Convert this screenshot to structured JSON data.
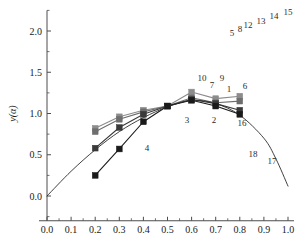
{
  "chart_data": {
    "type": "line",
    "title": "",
    "xlabel": "α",
    "ylabel": "y(α)",
    "xlim": [
      0.0,
      1.0
    ],
    "ylim": [
      -0.35,
      2.35
    ],
    "grid": false,
    "legend_position": "none",
    "x_ticks": [
      "0.0",
      "0.1",
      "0.2",
      "0.3",
      "0.4",
      "0.5",
      "0.6",
      "0.7",
      "0.8",
      "0.9",
      "1.0"
    ],
    "x_tick_values": [
      0.0,
      0.1,
      0.2,
      0.3,
      0.4,
      0.5,
      0.6,
      0.7,
      0.8,
      0.9,
      1.0
    ],
    "y_ticks": [
      "0.0",
      "0.5",
      "1.0",
      "1.5",
      "2.0"
    ],
    "y_tick_values": [
      0.0,
      0.5,
      1.0,
      1.5,
      2.0
    ],
    "series": [
      {
        "name": "series-1",
        "color": "#8c8c8c",
        "marker": "square",
        "x": [
          0.2,
          0.3,
          0.4,
          0.5,
          0.6,
          0.7,
          0.8
        ],
        "values": [
          0.82,
          0.96,
          1.04,
          1.09,
          1.26,
          1.18,
          1.21
        ]
      },
      {
        "name": "series-2",
        "color": "#6e6e6e",
        "marker": "square",
        "x": [
          0.2,
          0.3,
          0.4,
          0.5,
          0.6,
          0.7,
          0.8
        ],
        "values": [
          0.78,
          0.93,
          1.02,
          1.09,
          1.19,
          1.13,
          1.15
        ]
      },
      {
        "name": "series-3",
        "color": "#3a3a3a",
        "marker": "square",
        "x": [
          0.2,
          0.3,
          0.4,
          0.5,
          0.6,
          0.7,
          0.8
        ],
        "values": [
          0.58,
          0.83,
          0.99,
          1.09,
          1.17,
          1.12,
          1.04
        ]
      },
      {
        "name": "series-4",
        "color": "#1a1a1a",
        "marker": "square",
        "x": [
          0.2,
          0.3,
          0.4,
          0.5,
          0.6,
          0.7,
          0.8
        ],
        "values": [
          0.25,
          0.57,
          0.9,
          1.09,
          1.16,
          1.09,
          0.99
        ]
      },
      {
        "name": "series-theory",
        "color": "#2b2b2b",
        "marker": "none",
        "x": [
          0.0,
          0.1,
          0.2,
          0.3,
          0.4,
          0.5,
          0.6,
          0.7,
          0.8,
          0.9,
          0.95,
          1.0
        ],
        "values": [
          0.0,
          0.3,
          0.56,
          0.78,
          0.95,
          1.08,
          1.16,
          1.12,
          0.98,
          0.7,
          0.45,
          0.12
        ]
      }
    ],
    "annotations": [
      {
        "text": "15",
        "x_px": 288,
        "y_px": 15
      },
      {
        "text": "14",
        "x_px": 274,
        "y_px": 19
      },
      {
        "text": "13",
        "x_px": 261,
        "y_px": 24
      },
      {
        "text": "12",
        "x_px": 248,
        "y_px": 28
      },
      {
        "text": "8",
        "x_px": 240,
        "y_px": 32
      },
      {
        "text": "5",
        "x_px": 232,
        "y_px": 36
      },
      {
        "text": "10",
        "x_px": 202,
        "y_px": 81
      },
      {
        "text": "9",
        "x_px": 222,
        "y_px": 81
      },
      {
        "text": "7",
        "x_px": 212,
        "y_px": 88
      },
      {
        "text": "1",
        "x_px": 229,
        "y_px": 92
      },
      {
        "text": "6",
        "x_px": 245,
        "y_px": 89
      },
      {
        "text": "3",
        "x_px": 187,
        "y_px": 123
      },
      {
        "text": "2",
        "x_px": 214,
        "y_px": 123
      },
      {
        "text": "16",
        "x_px": 242,
        "y_px": 126
      },
      {
        "text": "18",
        "x_px": 253,
        "y_px": 157
      },
      {
        "text": "17",
        "x_px": 272,
        "y_px": 164
      },
      {
        "text": "4",
        "x_px": 147,
        "y_px": 151
      }
    ]
  },
  "axes": {
    "x_title": "α",
    "y_title": "y(α)"
  },
  "colors": {
    "axis": "#4d4d4d",
    "text": "#1a1a1a",
    "background": "#ffffff"
  }
}
